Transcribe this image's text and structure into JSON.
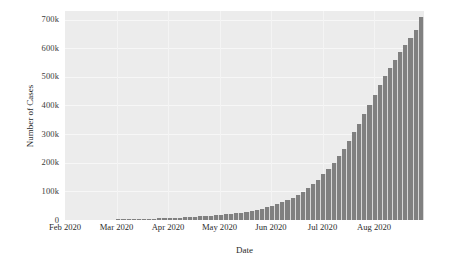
{
  "chart_data": {
    "type": "bar",
    "title": "",
    "xlabel": "Date",
    "ylabel": "Number of Cases",
    "grid": true,
    "legend": false,
    "xlim": [
      "Feb 2020",
      "Sep 2020"
    ],
    "ylim": [
      0,
      730000
    ],
    "ytick_labels": [
      "700k",
      "600k",
      "500k",
      "400k",
      "300k",
      "200k",
      "100k",
      "0"
    ],
    "ytick_values": [
      700000,
      600000,
      500000,
      400000,
      300000,
      200000,
      100000,
      0
    ],
    "xtick_labels": [
      "Feb 2020",
      "Mar 2020",
      "Apr 2020",
      "May 2020",
      "Jun 2020",
      "Jul 2020",
      "Aug 2020"
    ],
    "bar_color": "#808080",
    "panel_color": "#ececec",
    "gridline_color": "#f7f7f7",
    "categories": [
      "2020-02-01",
      "2020-02-04",
      "2020-02-07",
      "2020-02-10",
      "2020-02-13",
      "2020-02-16",
      "2020-02-19",
      "2020-02-22",
      "2020-02-25",
      "2020-02-28",
      "2020-03-02",
      "2020-03-05",
      "2020-03-08",
      "2020-03-11",
      "2020-03-14",
      "2020-03-17",
      "2020-03-20",
      "2020-03-23",
      "2020-03-26",
      "2020-03-29",
      "2020-04-01",
      "2020-04-04",
      "2020-04-07",
      "2020-04-10",
      "2020-04-13",
      "2020-04-16",
      "2020-04-19",
      "2020-04-22",
      "2020-04-25",
      "2020-04-28",
      "2020-05-01",
      "2020-05-04",
      "2020-05-07",
      "2020-05-10",
      "2020-05-13",
      "2020-05-16",
      "2020-05-19",
      "2020-05-22",
      "2020-05-25",
      "2020-05-28",
      "2020-05-31",
      "2020-06-03",
      "2020-06-06",
      "2020-06-09",
      "2020-06-12",
      "2020-06-15",
      "2020-06-18",
      "2020-06-21",
      "2020-06-24",
      "2020-06-27",
      "2020-06-30",
      "2020-07-03",
      "2020-07-06",
      "2020-07-09",
      "2020-07-12",
      "2020-07-15",
      "2020-07-18",
      "2020-07-21",
      "2020-07-24",
      "2020-07-27",
      "2020-07-30",
      "2020-08-02",
      "2020-08-05",
      "2020-08-08",
      "2020-08-11",
      "2020-08-14",
      "2020-08-17",
      "2020-08-20",
      "2020-08-23",
      "2020-08-26"
    ],
    "values": [
      200,
      300,
      420,
      560,
      700,
      860,
      1000,
      1200,
      1400,
      1650,
      1900,
      2200,
      2500,
      2900,
      3300,
      3800,
      4300,
      4900,
      5500,
      6200,
      6900,
      7700,
      8500,
      9400,
      10300,
      11300,
      12400,
      13600,
      14900,
      16300,
      17800,
      19500,
      21400,
      23500,
      25900,
      28600,
      31700,
      35200,
      39200,
      43800,
      49000,
      55000,
      61800,
      69500,
      78200,
      88000,
      99000,
      111500,
      125500,
      141500,
      159000,
      178500,
      200000,
      223500,
      249000,
      276500,
      306000,
      337000,
      369500,
      403000,
      437000,
      470000,
      502000,
      532000,
      560000,
      586000,
      610000,
      637000,
      665000,
      710000
    ]
  }
}
